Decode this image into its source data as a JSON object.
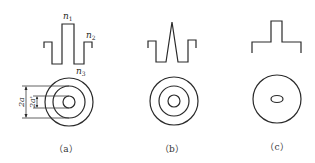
{
  "figure": {
    "panels": [
      {
        "id": "a",
        "caption": "（a）",
        "profile": "step-index with raised core and depressed inner cladding (W-profile)",
        "labels": {
          "n1": "n",
          "n1_sub": "1",
          "n2": "n",
          "n2_sub": "2",
          "n3": "n",
          "n3_sub": "3"
        },
        "dimensions": {
          "outer": "2a",
          "inner": "2a'"
        },
        "cross_section": "three concentric circles"
      },
      {
        "id": "b",
        "caption": "（b）",
        "profile": "triangular core with depressed cladding",
        "cross_section": "three concentric circles"
      },
      {
        "id": "c",
        "caption": "（c）",
        "profile": "step-index",
        "cross_section": "circle with elliptical core"
      }
    ]
  }
}
